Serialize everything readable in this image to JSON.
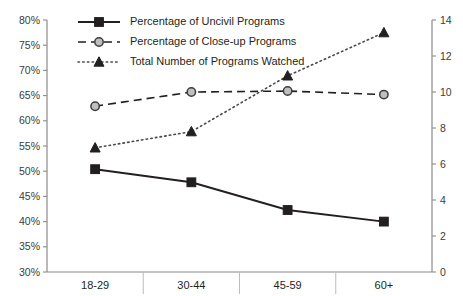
{
  "chart_data": {
    "type": "line",
    "title": "",
    "xlabel": "",
    "ylabel": "",
    "grid": false,
    "legend_position": "top-left",
    "categories": [
      "18-29",
      "30-44",
      "45-59",
      "60+"
    ],
    "axes": {
      "left": {
        "ylim": [
          30,
          80
        ],
        "tick_step": 5,
        "ticks": [
          "30%",
          "35%",
          "40%",
          "45%",
          "50%",
          "55%",
          "60%",
          "65%",
          "70%",
          "75%",
          "80%"
        ],
        "tick_values": [
          30,
          35,
          40,
          45,
          50,
          55,
          60,
          65,
          70,
          75,
          80
        ]
      },
      "right": {
        "ylim": [
          0,
          14
        ],
        "tick_step": 2,
        "ticks": [
          "0",
          "2",
          "4",
          "6",
          "8",
          "10",
          "12",
          "14"
        ],
        "tick_values": [
          0,
          2,
          4,
          6,
          8,
          10,
          12,
          14
        ]
      }
    },
    "series": [
      {
        "name": "Percentage of Uncivil Programs",
        "axis": "left",
        "marker": "square",
        "line_style": "solid",
        "color": "#231f20",
        "values": [
          50.4,
          47.8,
          42.3,
          40.0
        ]
      },
      {
        "name": "Percentage of Close-up Programs",
        "axis": "left",
        "marker": "circle",
        "line_style": "dashed",
        "color": "#231f20",
        "values": [
          62.9,
          65.7,
          65.9,
          65.2
        ]
      },
      {
        "name": "Total Number of Programs Watched",
        "axis": "right",
        "marker": "triangle",
        "line_style": "dotted",
        "color": "#4a4a4a",
        "values": [
          6.9,
          7.8,
          10.9,
          13.3
        ]
      }
    ]
  },
  "legend": {
    "items": [
      {
        "label": "Percentage of Uncivil Programs"
      },
      {
        "label": "Percentage of Close-up Programs"
      },
      {
        "label": "Total Number of Programs Watched"
      }
    ]
  }
}
